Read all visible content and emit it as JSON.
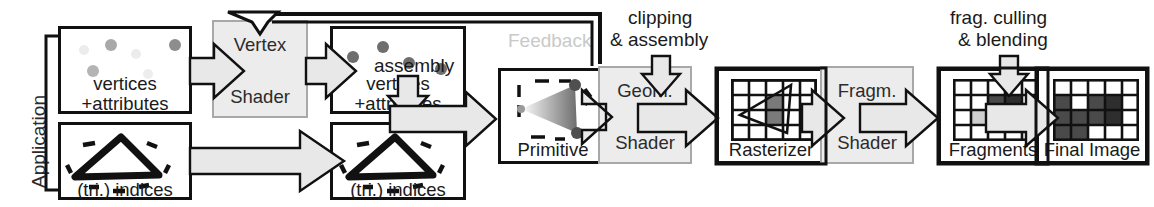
{
  "diagram": {
    "stage_label_application": "Application",
    "feedback_label": "Feedback",
    "colors": {
      "shader_fill": "#ececec",
      "shader_border": "#a8a8a8",
      "box_border": "#111111",
      "arrow_fill": "#e8e8e8",
      "feedback_text": "#c9c9c9",
      "dot_dark": "#6e6e6e",
      "dot_faded": "#e3e3e3",
      "cell_dark": "#4a4a4a",
      "cell_darker": "#2e2e2e",
      "cell_mid": "#7a7a7a",
      "cell_light": "#cfcfcf",
      "cell_empty": "#ffffff"
    },
    "stages": [
      {
        "id": "vertices-attributes-in",
        "line1": "vertices",
        "line2": "+attributes",
        "kind": "data"
      },
      {
        "id": "vertex-shader",
        "line1": "Vertex",
        "line2": "Shader",
        "kind": "shader"
      },
      {
        "id": "vertices-attributes-out",
        "line1": "vertices",
        "line2": "+attributes",
        "kind": "data"
      },
      {
        "id": "tri-indices-in",
        "line1": "",
        "line2": "(tri.) indices",
        "kind": "data"
      },
      {
        "id": "tri-indices-out",
        "line1": "",
        "line2": "(tri.) indices",
        "kind": "data"
      },
      {
        "id": "primitive",
        "line1": "",
        "line2": "Primitive",
        "kind": "data"
      },
      {
        "id": "geometry-shader",
        "line1": "Geom.",
        "line2": "Shader",
        "kind": "shader"
      },
      {
        "id": "rasterizer",
        "line1": "",
        "line2": "Rasterizer",
        "kind": "data"
      },
      {
        "id": "fragment-shader",
        "line1": "Fragm.",
        "line2": "Shader",
        "kind": "shader"
      },
      {
        "id": "fragments",
        "line1": "",
        "line2": "Fragments",
        "kind": "data"
      },
      {
        "id": "final-image",
        "line1": "",
        "line2": "Final Image",
        "kind": "data"
      }
    ],
    "labels": {
      "application": "Application",
      "assembly": "assembly",
      "feedback": "Feedback",
      "clipping_line1": "clipping",
      "clipping_line2": "& assembly",
      "culling_line1": "frag. culling",
      "culling_line2": "& blending",
      "vertices": "vertices",
      "attributes": "+attributes",
      "tri_indices": "(tri.) indices",
      "vertex": "Vertex",
      "shader": "Shader",
      "primitive": "Primitive",
      "geom": "Geom.",
      "rasterizer": "Rasterizer",
      "fragm": "Fragm.",
      "fragments": "Fragments",
      "final_image": "Final Image"
    },
    "grids": {
      "rasterizer": {
        "cols": 5,
        "rows": 4,
        "shaded": [
          [
            3,
            2,
            "#7a7a7a"
          ],
          [
            3,
            3,
            "#7a7a7a"
          ]
        ]
      },
      "fragments": {
        "cols": 5,
        "rows": 4,
        "cells": [
          [
            "#fff",
            "#fff",
            "#fff",
            "#fff",
            "#fff"
          ],
          [
            "#fff",
            "#fff",
            "#4a4a4a",
            "#2e2e2e",
            "#fff"
          ],
          [
            "#fff",
            "#cfcfcf",
            "#7a7a7a",
            "#2e2e2e",
            "#fff"
          ],
          [
            "#fff",
            "#fff",
            "#fff",
            "#fff",
            "#fff"
          ]
        ]
      },
      "final_image": {
        "cols": 5,
        "rows": 4,
        "cells": [
          [
            "#fff",
            "#fff",
            "#fff",
            "#fff",
            "#fff"
          ],
          [
            "#4a4a4a",
            "#fff",
            "#4a4a4a",
            "#2e2e2e",
            "#fff"
          ],
          [
            "#4a4a4a",
            "#4a4a4a",
            "#4a4a4a",
            "#2e2e2e",
            "#fff"
          ],
          [
            "#4a4a4a",
            "#4a4a4a",
            "#fff",
            "#fff",
            "#fff"
          ]
        ]
      }
    },
    "dots": {
      "vertices_in": [
        {
          "x": 18,
          "y": 16,
          "r": 5,
          "c": "#ececec"
        },
        {
          "x": 46,
          "y": 12,
          "r": 6,
          "c": "#a9a9a9"
        },
        {
          "x": 72,
          "y": 20,
          "r": 5,
          "c": "#ececec"
        },
        {
          "x": 28,
          "y": 36,
          "r": 6,
          "c": "#b4b4b4"
        },
        {
          "x": 82,
          "y": 40,
          "r": 5,
          "c": "#ededed"
        },
        {
          "x": 110,
          "y": 12,
          "r": 6,
          "c": "#8d8d8d"
        }
      ],
      "vertices_out": [
        {
          "x": 14,
          "y": 22,
          "r": 6,
          "c": "#6e6e6e"
        },
        {
          "x": 44,
          "y": 12,
          "r": 6,
          "c": "#6e6e6e"
        },
        {
          "x": 68,
          "y": 28,
          "r": 6,
          "c": "#6e6e6e"
        },
        {
          "x": 100,
          "y": 34,
          "r": 6,
          "c": "#6e6e6e"
        }
      ]
    }
  }
}
